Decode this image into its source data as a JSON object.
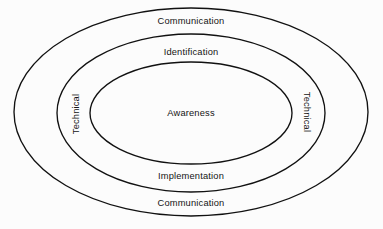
{
  "diagram": {
    "type": "concentric-ellipses",
    "background_color": "#fcfcfc",
    "stroke_color": "#111111",
    "text_color": "#141414",
    "rings": [
      {
        "id": "outer",
        "level": 3,
        "top_label": "Communication",
        "bottom_label": "Communication",
        "side_label": "Technical",
        "cx": 191,
        "cy": 112,
        "rx": 177,
        "ry": 104
      },
      {
        "id": "middle",
        "level": 2,
        "top_label": "Identification",
        "bottom_label": "Implementation",
        "side_label": "Technical",
        "cx": 191,
        "cy": 113,
        "rx": 134,
        "ry": 79
      },
      {
        "id": "inner",
        "level": 1,
        "center_label": "Awareness",
        "cx": 191,
        "cy": 113,
        "rx": 101,
        "ry": 51
      }
    ],
    "labels": {
      "outer_top": "Communication",
      "middle_top": "Identification",
      "left_side": "Technical",
      "right_side": "Technical",
      "center": "Awareness",
      "middle_bottom": "Implementation",
      "outer_bottom": "Communication"
    }
  }
}
